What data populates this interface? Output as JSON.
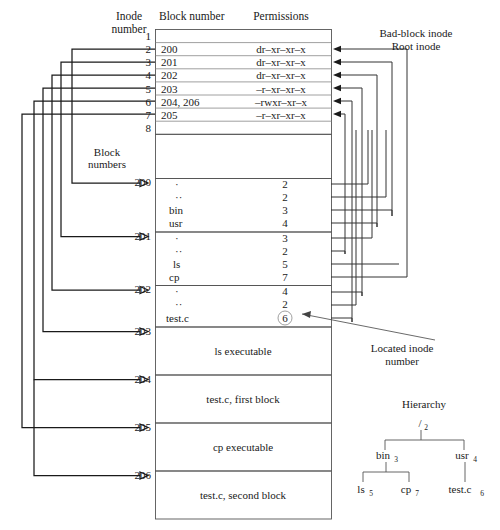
{
  "headers": {
    "inode_number": "Inode\nnumber",
    "inode_number_line1": "Inode",
    "inode_number_line2": "number",
    "block_number": "Block number",
    "permissions": "Permissions",
    "block_numbers_line1": "Block",
    "block_numbers_line2": "numbers"
  },
  "annotations": {
    "bad_block_inode": "Bad-block inode",
    "root_inode": "Root inode",
    "located_inode_line1": "Located inode",
    "located_inode_line2": "number",
    "hierarchy": "Hierarchy"
  },
  "inode_table": {
    "rows": [
      {
        "inode": "1",
        "block_number": "",
        "permissions": ""
      },
      {
        "inode": "2",
        "block_number": "200",
        "permissions": "dr–xr–xr–x"
      },
      {
        "inode": "3",
        "block_number": "201",
        "permissions": "dr–xr–xr–x"
      },
      {
        "inode": "4",
        "block_number": "202",
        "permissions": "dr–xr–xr–x"
      },
      {
        "inode": "5",
        "block_number": "203",
        "permissions": "–r–xr–xr–x"
      },
      {
        "inode": "6",
        "block_number": "204, 206",
        "permissions": "–rwxr–xr–x"
      },
      {
        "inode": "7",
        "block_number": "205",
        "permissions": "–r–xr–xr–x"
      },
      {
        "inode": "8",
        "block_number": "",
        "permissions": ""
      }
    ]
  },
  "blocks": [
    {
      "number": "200",
      "kind": "directory",
      "entries": [
        {
          "name": "·",
          "inode": "2",
          "circled": false
        },
        {
          "name": "··",
          "inode": "2",
          "circled": false
        },
        {
          "name": "bin",
          "inode": "3",
          "circled": false
        },
        {
          "name": "usr",
          "inode": "4",
          "circled": false
        }
      ]
    },
    {
      "number": "201",
      "kind": "directory",
      "entries": [
        {
          "name": "·",
          "inode": "3",
          "circled": false
        },
        {
          "name": "··",
          "inode": "2",
          "circled": false
        },
        {
          "name": "ls",
          "inode": "5",
          "circled": false
        },
        {
          "name": "cp",
          "inode": "7",
          "circled": false
        }
      ]
    },
    {
      "number": "202",
      "kind": "directory",
      "entries": [
        {
          "name": "·",
          "inode": "4",
          "circled": false
        },
        {
          "name": "··",
          "inode": "2",
          "circled": false
        },
        {
          "name": "test.c",
          "inode": "6",
          "circled": true
        }
      ]
    },
    {
      "number": "203",
      "kind": "data",
      "content": "ls executable"
    },
    {
      "number": "204",
      "kind": "data",
      "content": "test.c, first block"
    },
    {
      "number": "205",
      "kind": "data",
      "content": "cp executable"
    },
    {
      "number": "206",
      "kind": "data",
      "content": "test.c, second block"
    }
  ],
  "hierarchy": {
    "root": {
      "name": "/",
      "inode": "2"
    },
    "level1": [
      {
        "name": "bin",
        "inode": "3"
      },
      {
        "name": "usr",
        "inode": "4"
      }
    ],
    "level2_bin": [
      {
        "name": "ls",
        "inode": "5"
      },
      {
        "name": "cp",
        "inode": "7"
      }
    ],
    "level2_usr": [
      {
        "name": "test.c",
        "inode": "6"
      }
    ]
  },
  "colors": {
    "line": "#1a1a1a",
    "box": "#555555",
    "text": "#1a1a1a",
    "background": "#ffffff"
  }
}
